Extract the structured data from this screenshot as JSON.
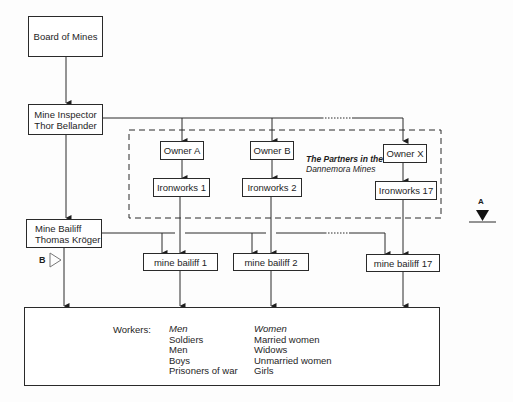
{
  "diagram": {
    "nodes": {
      "board_of_mines": {
        "label": "Board of Mines"
      },
      "mine_inspector": {
        "lines": [
          "Mine Inspector",
          "Thor Bellander"
        ]
      },
      "owner_a": {
        "label": "Owner A"
      },
      "owner_b": {
        "label": "Owner B"
      },
      "owner_x": {
        "label": "Owner X"
      },
      "ironworks_1": {
        "label": "Ironworks 1"
      },
      "ironworks_2": {
        "label": "Ironworks 2"
      },
      "ironworks_17": {
        "label": "Ironworks 17"
      },
      "mine_bailiff": {
        "lines": [
          "Mine Bailiff",
          "Thomas Kröger"
        ]
      },
      "mine_bailiff_1": {
        "label": "mine bailiff 1"
      },
      "mine_bailiff_2": {
        "label": "mine bailiff 2"
      },
      "mine_bailiff_17": {
        "label": "mine bailiff 17"
      }
    },
    "partners_group": {
      "lines": [
        "The Partners in the",
        "Dannemora Mines"
      ],
      "style": "dashed"
    },
    "markers": {
      "a": {
        "label": "A",
        "shape": "filled-down-triangle-on-line"
      },
      "b": {
        "label": "B",
        "shape": "outline-right-triangle"
      }
    },
    "workers": {
      "heading": "Workers:",
      "men": {
        "title": "Men",
        "items": [
          "Soldiers",
          "Men",
          "Boys",
          "Prisoners of war"
        ]
      },
      "women": {
        "title": "Women",
        "items": [
          "Married women",
          "Widows",
          "Unmarried women",
          "Girls"
        ]
      }
    },
    "edges": [
      [
        "board_of_mines",
        "mine_inspector"
      ],
      [
        "mine_inspector",
        "owner_a"
      ],
      [
        "mine_inspector",
        "owner_b"
      ],
      [
        "mine_inspector",
        "owner_x"
      ],
      [
        "mine_inspector",
        "mine_bailiff"
      ],
      [
        "owner_a",
        "ironworks_1"
      ],
      [
        "owner_b",
        "ironworks_2"
      ],
      [
        "owner_x",
        "ironworks_17"
      ],
      [
        "ironworks_1",
        "mine_bailiff_1"
      ],
      [
        "ironworks_2",
        "mine_bailiff_2"
      ],
      [
        "ironworks_17",
        "mine_bailiff_17"
      ],
      [
        "mine_bailiff",
        "mine_bailiff_1"
      ],
      [
        "mine_bailiff",
        "mine_bailiff_2"
      ],
      [
        "mine_bailiff",
        "mine_bailiff_17"
      ],
      [
        "mine_bailiff",
        "workers"
      ],
      [
        "mine_bailiff_1",
        "workers"
      ],
      [
        "mine_bailiff_2",
        "workers"
      ],
      [
        "mine_bailiff_17",
        "workers"
      ]
    ],
    "colors": {
      "line": "#2a2a2a",
      "background": "#fdfdfd"
    }
  }
}
